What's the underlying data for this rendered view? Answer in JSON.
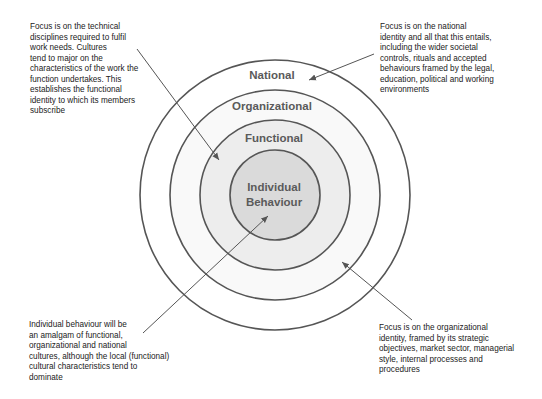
{
  "diagram": {
    "type": "concentric-circles",
    "rings": [
      {
        "label": "National",
        "radius": 135,
        "fill": "#ffffff"
      },
      {
        "label": "Organizational",
        "radius": 105,
        "fill": "#f8f8f8"
      },
      {
        "label": "Functional",
        "radius": 75,
        "fill": "#ececec"
      },
      {
        "label_line1": "Individual",
        "label_line2": "Behaviour",
        "radius": 45,
        "fill": "#d9d9d9"
      }
    ],
    "labels": {
      "national": "National",
      "organizational": "Organizational",
      "functional": "Functional",
      "individual_line1": "Individual",
      "individual_line2": "Behaviour"
    },
    "annotations": {
      "functional": "Focus is on the technical\ndisciplines required to fulfil\nwork needs. Cultures\ntend to major on the\ncharacteristics of the work the\nfunction undertakes. This\nestablishes the functional\nidentity to which its members\nsubscribe",
      "national": "Focus is on the national\nidentity and all that this entails,\nincluding the wider societal\ncontrols, rituals and accepted\nbehaviours framed by the legal,\neducation, political and working\nenvironments",
      "individual": "Individual behaviour will be\nan amalgam of functional,\norganizational and national\ncultures, although the local (functional)\ncultural characteristics tend to\ndominate",
      "organizational": "Focus is on the organizational\nidentity, framed by its strategic\nobjectives, market sector, managerial\nstyle, internal processes and\nprocedures"
    },
    "colors": {
      "stroke": "#555555",
      "label": "#5a5a5a",
      "text": "#222222"
    }
  }
}
